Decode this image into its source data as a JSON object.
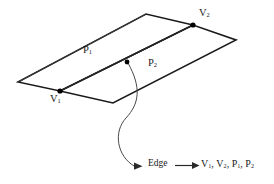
{
  "figure": {
    "background_color": "#ffffff",
    "stroke_color": "#1a1a1a",
    "vertices": [
      {
        "id": "v1",
        "label": "V",
        "subscript": "1",
        "x": 60,
        "y": 91
      },
      {
        "id": "v2",
        "label": "V",
        "subscript": "2",
        "x": 193,
        "y": 25
      }
    ],
    "faces": [
      {
        "id": "p1",
        "label": "P",
        "subscript": "1",
        "x": 83,
        "y": 45
      },
      {
        "id": "p2",
        "label": "P",
        "subscript": "2",
        "x": 148,
        "y": 58
      }
    ],
    "midpoint_marker": {
      "x": 127,
      "y": 62
    },
    "leader": {
      "from_x": 127,
      "from_y": 62,
      "to_x": 140,
      "to_y": 166,
      "arrow": "arrow-right"
    }
  },
  "annotation": {
    "entity_label": "Edge",
    "relation_arrow": "arrow-right",
    "components": [
      {
        "label": "V",
        "subscript": "1"
      },
      {
        "label": "V",
        "subscript": "2"
      },
      {
        "label": "P",
        "subscript": "1"
      },
      {
        "label": "P",
        "subscript": "2"
      }
    ],
    "components_text": "V1, V2, P1, P2"
  }
}
